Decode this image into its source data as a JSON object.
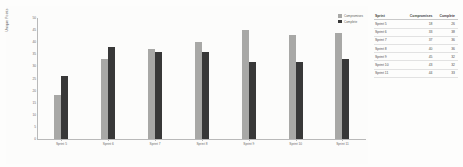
{
  "chart_data": {
    "type": "bar",
    "title": "",
    "xlabel": "",
    "ylabel": "Unique Points",
    "ylim": [
      0,
      50
    ],
    "yticks": [
      0,
      5,
      10,
      15,
      20,
      25,
      30,
      35,
      40,
      45,
      50
    ],
    "grid": false,
    "legend_position": "top-right",
    "categories": [
      "Sprint 5",
      "Sprint 6",
      "Sprint 7",
      "Sprint 8",
      "Sprint 9",
      "Sprint 10",
      "Sprint 11"
    ],
    "series": [
      {
        "name": "Compromises",
        "color": "#a8a8a6",
        "values": [
          18,
          33,
          37,
          40,
          45,
          43,
          44
        ]
      },
      {
        "name": "Complete",
        "color": "#383838",
        "values": [
          26,
          38,
          36,
          36,
          32,
          32,
          33
        ]
      }
    ]
  },
  "legend": {
    "items": [
      {
        "label": "Compromises",
        "color": "#a8a8a6"
      },
      {
        "label": "Complete",
        "color": "#383838"
      }
    ]
  },
  "axis": {
    "ylabel": "Unique Points",
    "yticks": [
      "0",
      "5",
      "10",
      "15",
      "20",
      "25",
      "30",
      "35",
      "40",
      "45",
      "50"
    ],
    "xticks": [
      "Sprint 5",
      "Sprint 6",
      "Sprint 7",
      "Sprint 8",
      "Sprint 9",
      "Sprint 10",
      "Sprint 11"
    ]
  },
  "table": {
    "headers": [
      "Sprint",
      "Compromises",
      "Complete"
    ],
    "rows": [
      {
        "sprint": "Sprint 5",
        "compromises": "18",
        "complete": "26"
      },
      {
        "sprint": "Sprint 6",
        "compromises": "33",
        "complete": "38"
      },
      {
        "sprint": "Sprint 7",
        "compromises": "37",
        "complete": "36"
      },
      {
        "sprint": "Sprint 8",
        "compromises": "40",
        "complete": "36"
      },
      {
        "sprint": "Sprint 9",
        "compromises": "45",
        "complete": "32"
      },
      {
        "sprint": "Sprint 10",
        "compromises": "43",
        "complete": "32"
      },
      {
        "sprint": "Sprint 11",
        "compromises": "44",
        "complete": "33"
      }
    ]
  },
  "colors": {
    "series_a": "#a8a8a6",
    "series_b": "#383838",
    "axis": "#b9b9b9",
    "background": "#fdfdfc"
  }
}
